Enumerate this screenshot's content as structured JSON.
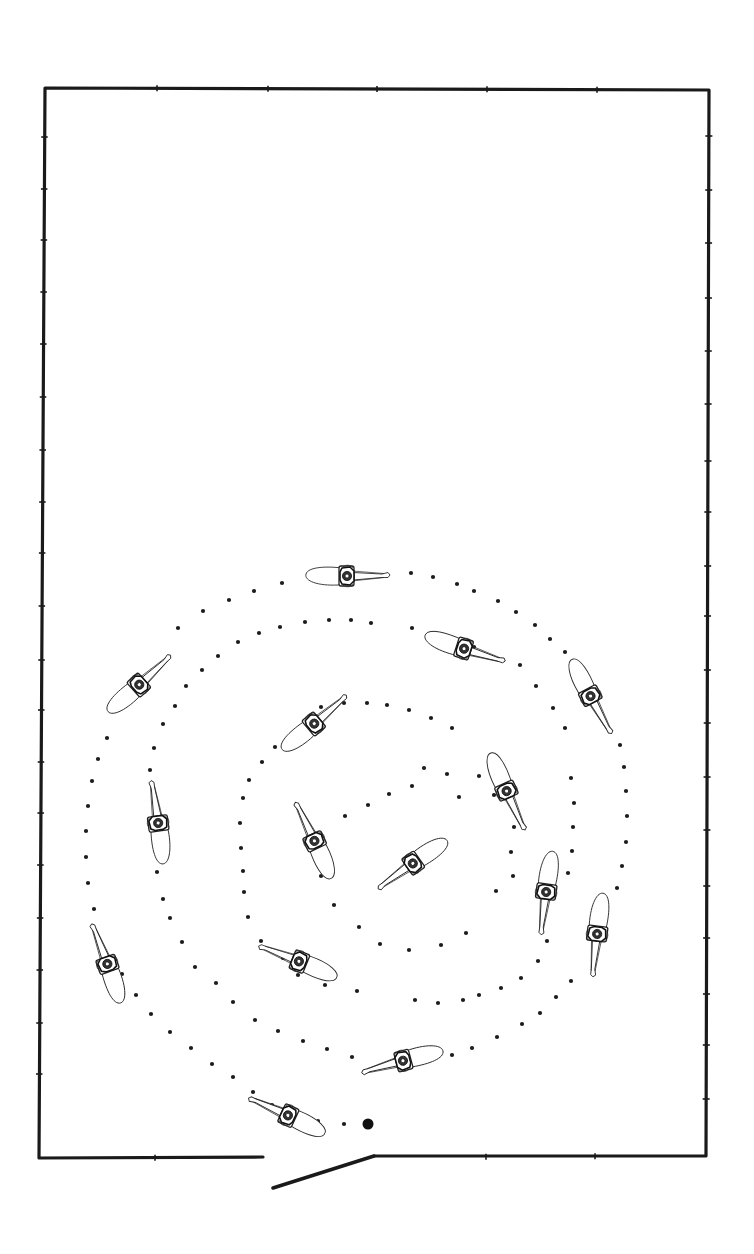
{
  "diagram": {
    "colors": {
      "ink": "#1a1a1a",
      "background": "#ffffff"
    },
    "arena": {
      "corners": {
        "top_left": [
          45,
          88
        ],
        "top_right": [
          709,
          90
        ],
        "bottom_right": [
          706,
          1156
        ],
        "bottom_left": [
          39,
          1158
        ]
      },
      "bottom_left_segment_end": [
        263,
        1157
      ],
      "bottom_right_segment_start": [
        374,
        1156
      ],
      "top_ticks": [
        157,
        268,
        377,
        487,
        597
      ],
      "left_ticks": [
        137,
        189,
        240,
        292,
        344,
        397,
        450,
        502,
        553,
        606,
        660,
        710,
        762,
        813,
        865,
        918,
        970,
        1023,
        1074
      ],
      "right_ticks": [
        136,
        190,
        243,
        298,
        351,
        404,
        461,
        512,
        566,
        616,
        670,
        723,
        777,
        830,
        886,
        938,
        994,
        1045,
        1099
      ],
      "bottom_ticks": [
        155,
        486,
        595
      ]
    },
    "gate": {
      "from": [
        374,
        1156
      ],
      "to": [
        273,
        1188
      ],
      "state": "open"
    },
    "start_point": {
      "x": 368,
      "y": 1124,
      "r": 5.5
    },
    "path": {
      "style": "dotted spiral",
      "dots": [
        [
          344,
          1124
        ],
        [
          318,
          1121
        ],
        [
          293,
          1113
        ],
        [
          272,
          1105
        ],
        [
          253,
          1092
        ],
        [
          233,
          1077
        ],
        [
          212,
          1064
        ],
        [
          191,
          1048
        ],
        [
          170,
          1032
        ],
        [
          151,
          1014
        ],
        [
          136,
          995
        ],
        [
          122,
          974
        ],
        [
          94,
          909
        ],
        [
          88,
          883
        ],
        [
          86,
          857
        ],
        [
          86,
          831
        ],
        [
          88,
          806
        ],
        [
          92,
          781
        ],
        [
          98,
          759
        ],
        [
          107,
          738
        ],
        [
          178,
          628
        ],
        [
          203,
          611
        ],
        [
          229,
          600
        ],
        [
          254,
          591
        ],
        [
          282,
          583
        ],
        [
          411,
          573
        ],
        [
          433,
          577
        ],
        [
          457,
          584
        ],
        [
          474,
          591
        ],
        [
          498,
          601
        ],
        [
          516,
          612
        ],
        [
          535,
          625
        ],
        [
          550,
          639
        ],
        [
          565,
          652
        ],
        [
          620,
          745
        ],
        [
          624,
          767
        ],
        [
          626,
          791
        ],
        [
          627,
          816
        ],
        [
          626,
          842
        ],
        [
          622,
          866
        ],
        [
          617,
          888
        ],
        [
          571,
          981
        ],
        [
          556,
          997
        ],
        [
          540,
          1013
        ],
        [
          522,
          1024
        ],
        [
          497,
          1037
        ],
        [
          472,
          1048
        ],
        [
          452,
          1055
        ],
        [
          352,
          1057
        ],
        [
          327,
          1049
        ],
        [
          303,
          1041
        ],
        [
          278,
          1031
        ],
        [
          255,
          1020
        ],
        [
          233,
          1002
        ],
        [
          216,
          983
        ],
        [
          195,
          967
        ],
        [
          182,
          942
        ],
        [
          170,
          918
        ],
        [
          163,
          899
        ],
        [
          157,
          872
        ],
        [
          150,
          770
        ],
        [
          154,
          748
        ],
        [
          163,
          724
        ],
        [
          175,
          706
        ],
        [
          186,
          686
        ],
        [
          202,
          670
        ],
        [
          218,
          656
        ],
        [
          238,
          642
        ],
        [
          259,
          633
        ],
        [
          280,
          627
        ],
        [
          305,
          622
        ],
        [
          329,
          620
        ],
        [
          351,
          620
        ],
        [
          371,
          623
        ],
        [
          412,
          628
        ],
        [
          437,
          637
        ],
        [
          474,
          647
        ],
        [
          520,
          665
        ],
        [
          536,
          686
        ],
        [
          553,
          708
        ],
        [
          565,
          728
        ],
        [
          571,
          778
        ],
        [
          574,
          803
        ],
        [
          573,
          827
        ],
        [
          572,
          851
        ],
        [
          568,
          873
        ],
        [
          547,
          941
        ],
        [
          538,
          961
        ],
        [
          521,
          978
        ],
        [
          501,
          988
        ],
        [
          479,
          995
        ],
        [
          463,
          1000
        ],
        [
          438,
          1003
        ],
        [
          415,
          1000
        ],
        [
          357,
          991
        ],
        [
          325,
          985
        ],
        [
          298,
          975
        ],
        [
          283,
          958
        ],
        [
          261,
          941
        ],
        [
          248,
          917
        ],
        [
          244,
          892
        ],
        [
          243,
          871
        ],
        [
          241,
          848
        ],
        [
          240,
          823
        ],
        [
          243,
          798
        ],
        [
          249,
          780
        ],
        [
          262,
          762
        ],
        [
          275,
          747
        ],
        [
          321,
          707
        ],
        [
          344,
          703
        ],
        [
          367,
          703
        ],
        [
          387,
          705
        ],
        [
          409,
          710
        ],
        [
          431,
          718
        ],
        [
          452,
          728
        ],
        [
          479,
          776
        ],
        [
          494,
          795
        ],
        [
          514,
          827
        ],
        [
          511,
          852
        ],
        [
          513,
          876
        ],
        [
          496,
          891
        ],
        [
          466,
          933
        ],
        [
          441,
          945
        ],
        [
          409,
          950
        ],
        [
          380,
          944
        ],
        [
          359,
          927
        ],
        [
          334,
          905
        ],
        [
          321,
          876
        ],
        [
          345,
          816
        ],
        [
          368,
          805
        ],
        [
          389,
          794
        ],
        [
          412,
          786
        ],
        [
          424,
          768
        ],
        [
          447,
          774
        ],
        [
          459,
          797
        ]
      ]
    },
    "horses": [
      {
        "id": 1,
        "x": 348,
        "y": 576,
        "heading": 0
      },
      {
        "id": 2,
        "x": 140,
        "y": 684,
        "heading": -42
      },
      {
        "id": 3,
        "x": 465,
        "y": 649,
        "heading": 18
      },
      {
        "id": 4,
        "x": 591,
        "y": 697,
        "heading": 62
      },
      {
        "id": 5,
        "x": 315,
        "y": 723,
        "heading": -40
      },
      {
        "id": 6,
        "x": 158,
        "y": 822,
        "heading": -98
      },
      {
        "id": 7,
        "x": 507,
        "y": 792,
        "heading": 66
      },
      {
        "id": 8,
        "x": 314,
        "y": 840,
        "heading": -115
      },
      {
        "id": 9,
        "x": 412,
        "y": 864,
        "heading": 145
      },
      {
        "id": 10,
        "x": 546,
        "y": 893,
        "heading": 98
      },
      {
        "id": 11,
        "x": 597,
        "y": 935,
        "heading": 97
      },
      {
        "id": 12,
        "x": 107,
        "y": 963,
        "heading": -110
      },
      {
        "id": 13,
        "x": 298,
        "y": 961,
        "heading": -158
      },
      {
        "id": 14,
        "x": 402,
        "y": 1061,
        "heading": 165
      },
      {
        "id": 15,
        "x": 287,
        "y": 1115,
        "heading": -155
      }
    ]
  }
}
